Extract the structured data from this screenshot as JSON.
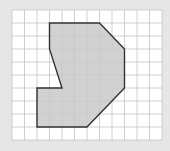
{
  "figure": {
    "colors": {
      "page_background": "#e6e6e6",
      "grid_background": "#ffffff",
      "grid_line": "#c4c4c4",
      "shape_fill": "#c9c9c9",
      "shape_outline": "#333333"
    },
    "grid": {
      "columns": 12,
      "rows": 10,
      "origin_px": [
        12,
        10
      ],
      "cell_width_px": 12.5,
      "cell_height_px": 13
    },
    "polygon_vertices_grid": [
      [
        3,
        1
      ],
      [
        7,
        1
      ],
      [
        9,
        3
      ],
      [
        9,
        6
      ],
      [
        6,
        9
      ],
      [
        2,
        9
      ],
      [
        2,
        6
      ],
      [
        4,
        6
      ],
      [
        3,
        3
      ]
    ]
  }
}
